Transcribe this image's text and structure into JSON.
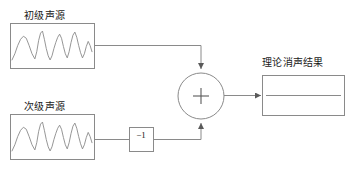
{
  "diagram": {
    "title": "",
    "colors": {
      "stroke": "#8a8a8a",
      "wave_stroke": "#8a8a8a",
      "text": "#1a1a1a",
      "background": "#ffffff"
    },
    "blocks": {
      "primary_source": {
        "label": "初级声源",
        "x": 10,
        "y": 23,
        "width": 84,
        "height": 45,
        "content": "waveform"
      },
      "secondary_source": {
        "label": "次级声源",
        "x": 10,
        "y": 114,
        "width": 84,
        "height": 45,
        "content": "waveform"
      },
      "inverter": {
        "label": "−1",
        "x": 129,
        "y": 127,
        "width": 24,
        "height": 24
      },
      "summing_junction": {
        "label": "+",
        "cx": 201,
        "cy": 96,
        "r": 23
      },
      "result": {
        "label": "理论消声结果",
        "x": 262,
        "y": 75,
        "width": 82,
        "height": 40,
        "content": "flat-line"
      }
    },
    "connections": [
      {
        "name": "primary-to-sum",
        "path": "M94,45 L201,45 L201,70",
        "arrow": "down"
      },
      {
        "name": "secondary-to-inverter",
        "path": "M94,139 L129,139",
        "arrow": "none"
      },
      {
        "name": "inverter-to-sum",
        "path": "M153,139 L201,139 L201,122",
        "arrow": "up"
      },
      {
        "name": "sum-to-result",
        "path": "M224,96 L262,96",
        "arrow": "right"
      }
    ],
    "waveform_points": "0,30 3,24 6,16 9,10 12,7 15,9 18,16 21,24 24,29 26,22 28,11 30,4 32,2 34,10 36,19 38,26 40,30 42,26 44,19 46,13 48,8 50,5 52,9 54,17 56,24 58,28 60,22 62,13 64,6 66,3 68,8 70,16 72,23 74,28 76,24 78,17 80,12 82,16 84,22"
  }
}
